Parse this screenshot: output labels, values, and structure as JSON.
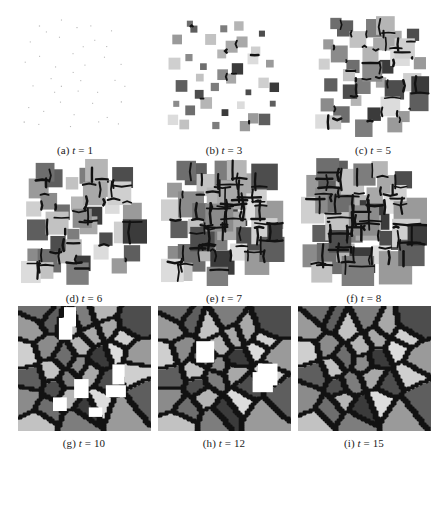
{
  "figure": {
    "kind": "grain-growth-simulation-montage",
    "background_color": "#ffffff",
    "rows": 3,
    "columns": 3,
    "caption_font_style": "serif-italic-variable"
  },
  "panels": [
    {
      "id": "a",
      "label": "(a)",
      "var": "t",
      "eq": "=",
      "time": "1",
      "caption": "(a) t = 1",
      "stage": "nucleation"
    },
    {
      "id": "b",
      "label": "(b)",
      "var": "t",
      "eq": "=",
      "time": "3",
      "caption": "(b) t = 3",
      "stage": "early-growth"
    },
    {
      "id": "c",
      "label": "(c)",
      "var": "t",
      "eq": "=",
      "time": "5",
      "caption": "(c) t = 5",
      "stage": "growth"
    },
    {
      "id": "d",
      "label": "(d)",
      "var": "t",
      "eq": "=",
      "time": "6",
      "caption": "(d) t = 6",
      "stage": "growth"
    },
    {
      "id": "e",
      "label": "(e)",
      "var": "t",
      "eq": "=",
      "time": "7",
      "caption": "(e) t = 7",
      "stage": "impingement-start"
    },
    {
      "id": "f",
      "label": "(f)",
      "var": "t",
      "eq": "=",
      "time": "8",
      "caption": "(f) t = 8",
      "stage": "impingement"
    },
    {
      "id": "g",
      "label": "(g)",
      "var": "t",
      "eq": "=",
      "time": "10",
      "caption": "(g) t = 10",
      "stage": "coalescence"
    },
    {
      "id": "h",
      "label": "(h)",
      "var": "t",
      "eq": "=",
      "time": "12",
      "caption": "(h) t = 12",
      "stage": "near-full"
    },
    {
      "id": "i",
      "label": "(i)",
      "var": "t",
      "eq": "=",
      "time": "15",
      "caption": "(i) t = 15",
      "stage": "fully-impinged"
    }
  ],
  "chart_data": {
    "type": "heatmap",
    "title": "",
    "xlabel": "",
    "ylabel": "",
    "categories": [
      "t=1",
      "t=3",
      "t=5",
      "t=6",
      "t=7",
      "t=8",
      "t=10",
      "t=12",
      "t=15"
    ],
    "series": [
      {
        "name": "time_step",
        "values": [
          1,
          3,
          5,
          6,
          7,
          8,
          10,
          12,
          15
        ]
      },
      {
        "name": "grain_count",
        "values": [
          40,
          40,
          40,
          39,
          38,
          37,
          35,
          34,
          33
        ]
      },
      {
        "name": "mean_grain_edge_px",
        "values": [
          1,
          7,
          13,
          16,
          19,
          22,
          27,
          30,
          33
        ]
      },
      {
        "name": "area_fraction_transformed",
        "values": [
          0.01,
          0.12,
          0.32,
          0.45,
          0.58,
          0.7,
          0.9,
          0.97,
          1.0
        ]
      }
    ],
    "grayscale_levels": [
      "#3b3b3b",
      "#4d4d4d",
      "#5e5e5e",
      "#6e6e6e",
      "#7d7d7d",
      "#8b8b8b",
      "#9a9a9a",
      "#a8a8a8",
      "#b5b5b5",
      "#c2c2c2",
      "#cfcfcf",
      "#dcdcdc"
    ],
    "boundary_color": "#121212",
    "legend": "none",
    "grid": false
  },
  "render_seeds": {
    "seed_positions": [
      [
        0.1,
        0.22
      ],
      [
        0.24,
        0.12
      ],
      [
        0.38,
        0.18
      ],
      [
        0.52,
        0.1
      ],
      [
        0.68,
        0.2
      ],
      [
        0.84,
        0.14
      ],
      [
        0.06,
        0.4
      ],
      [
        0.2,
        0.34
      ],
      [
        0.33,
        0.42
      ],
      [
        0.47,
        0.33
      ],
      [
        0.6,
        0.44
      ],
      [
        0.74,
        0.36
      ],
      [
        0.9,
        0.42
      ],
      [
        0.12,
        0.58
      ],
      [
        0.27,
        0.52
      ],
      [
        0.4,
        0.62
      ],
      [
        0.55,
        0.55
      ],
      [
        0.7,
        0.64
      ],
      [
        0.85,
        0.57
      ],
      [
        0.08,
        0.76
      ],
      [
        0.22,
        0.82
      ],
      [
        0.36,
        0.74
      ],
      [
        0.5,
        0.84
      ],
      [
        0.64,
        0.76
      ],
      [
        0.78,
        0.86
      ],
      [
        0.92,
        0.74
      ],
      [
        0.16,
        0.92
      ],
      [
        0.44,
        0.94
      ],
      [
        0.58,
        0.26
      ],
      [
        0.3,
        0.66
      ],
      [
        0.8,
        0.28
      ],
      [
        0.48,
        0.48
      ],
      [
        0.18,
        0.08
      ],
      [
        0.62,
        0.08
      ],
      [
        0.94,
        0.6
      ],
      [
        0.04,
        0.9
      ],
      [
        0.7,
        0.92
      ],
      [
        0.88,
        0.9
      ],
      [
        0.36,
        0.04
      ],
      [
        0.52,
        0.66
      ]
    ],
    "seed_shades": [
      6,
      2,
      9,
      4,
      7,
      1,
      10,
      5,
      3,
      8,
      0,
      11,
      6,
      2,
      9,
      4,
      7,
      1,
      10,
      5,
      3,
      8,
      0,
      11,
      6,
      2,
      9,
      4,
      7,
      1,
      10,
      5,
      3,
      8,
      0,
      11,
      6,
      2,
      9,
      4
    ]
  }
}
